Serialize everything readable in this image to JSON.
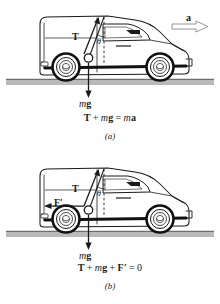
{
  "figure": {
    "type": "physics-free-body-diagram",
    "colors": {
      "ink": "#1a1a1a",
      "ground": "#b9b9b9",
      "ground_edge": "#6e6e6e",
      "tire": "#111111",
      "background": "#ffffff"
    }
  },
  "panels": [
    {
      "id": "a",
      "label": "(a)",
      "equation": {
        "terms": [
          "T",
          "mg",
          "ma"
        ],
        "tension": "T",
        "plus": "+",
        "weight_m": "m",
        "weight_g": "g",
        "equals": "=",
        "mass_m": "m",
        "accel_a": "a"
      },
      "vectors": [
        {
          "name": "tension",
          "label": "T",
          "direction": "up-right-along-string"
        },
        {
          "name": "weight",
          "label_m": "m",
          "label_g": "g",
          "direction": "down"
        },
        {
          "name": "acceleration",
          "label": "a",
          "direction": "right"
        }
      ],
      "angle_label": "θ",
      "has_acceleration_arrow": true
    },
    {
      "id": "b",
      "label": "(b)",
      "equation": {
        "terms": [
          "T",
          "mg",
          "F'",
          "0"
        ],
        "tension": "T",
        "plus": "+",
        "weight_m": "m",
        "weight_g": "g",
        "pseudo_force": "F",
        "prime": "′",
        "equals": "=",
        "zero": "0"
      },
      "vectors": [
        {
          "name": "tension",
          "label": "T",
          "direction": "up-right-along-string"
        },
        {
          "name": "weight",
          "label_m": "m",
          "label_g": "g",
          "direction": "down"
        },
        {
          "name": "pseudo-force",
          "label": "F",
          "prime": "′",
          "direction": "left"
        }
      ],
      "angle_label": "θ",
      "has_acceleration_arrow": false
    }
  ]
}
